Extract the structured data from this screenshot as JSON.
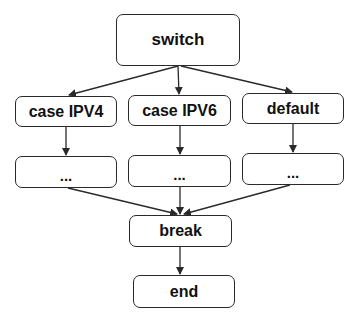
{
  "diagram": {
    "type": "flowchart",
    "nodes": {
      "switch": {
        "label": "switch"
      },
      "case_ipv4": {
        "label": "case IPV4"
      },
      "case_ipv6": {
        "label": "case IPV6"
      },
      "default": {
        "label": "default"
      },
      "body_ipv4": {
        "label": "..."
      },
      "body_ipv6": {
        "label": "..."
      },
      "body_default": {
        "label": "..."
      },
      "break": {
        "label": "break"
      },
      "end": {
        "label": "end"
      }
    },
    "edges": [
      {
        "from": "switch",
        "to": "case IPV4"
      },
      {
        "from": "switch",
        "to": "case IPV6"
      },
      {
        "from": "switch",
        "to": "default"
      },
      {
        "from": "case IPV4",
        "to": "..."
      },
      {
        "from": "case IPV6",
        "to": "..."
      },
      {
        "from": "default",
        "to": "..."
      },
      {
        "from": "...",
        "to": "break"
      },
      {
        "from": "...",
        "to": "break"
      },
      {
        "from": "...",
        "to": "break"
      },
      {
        "from": "break",
        "to": "end"
      }
    ],
    "colors": {
      "stroke": "#2a2a2a",
      "fill": "#ffffff",
      "text": "#111111"
    }
  }
}
